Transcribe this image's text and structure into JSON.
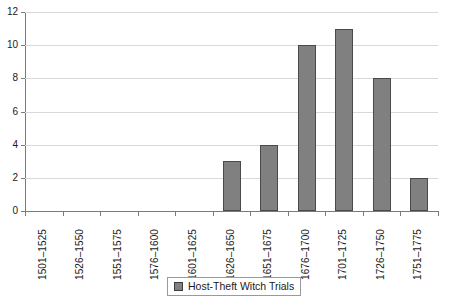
{
  "chart_data": {
    "type": "bar",
    "title": "",
    "subtitle": "",
    "xlabel": "",
    "ylabel": "",
    "categories": [
      "1501–1525",
      "1526–1550",
      "1551–1575",
      "1576–1600",
      "1601–1625",
      "1626–1650",
      "1651–1675",
      "1676–1700",
      "1701–1725",
      "1726–1750",
      "1751–1775"
    ],
    "series": [
      {
        "name": "Host-Theft Witch Trials",
        "values": [
          0,
          0,
          0,
          0,
          0,
          3,
          4,
          10,
          11,
          8,
          2
        ],
        "color": "#808080"
      }
    ],
    "ylim": [
      0,
      12
    ],
    "yticks": [
      0,
      2,
      4,
      6,
      8,
      10,
      12
    ],
    "ytick_labels": [
      "0",
      "2",
      "4",
      "6",
      "8",
      "10",
      "12"
    ],
    "grid": "horizontal",
    "grid_color": "#d9d9d9",
    "axis_color": "#7a7a7a",
    "legend": {
      "position": "bottom-center",
      "entries": [
        {
          "label": "Host-Theft Witch Trials",
          "color": "#808080"
        }
      ]
    },
    "annotations": []
  }
}
